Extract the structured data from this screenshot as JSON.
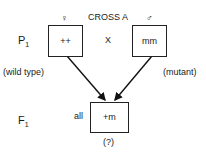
{
  "title": "CROSS A",
  "female_symbol": "♀",
  "male_symbol": "♂",
  "p1": {
    "label": "P",
    "subscript": "1",
    "female_genotype": "++",
    "male_genotype": "mm",
    "cross_symbol": "X",
    "female_phenotype": "(wild type)",
    "male_phenotype": "(mutant)"
  },
  "f1": {
    "label": "F",
    "subscript": "1",
    "quantifier": "all",
    "genotype": "+m",
    "phenotype": "(?)"
  }
}
